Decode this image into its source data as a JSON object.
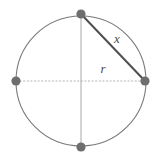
{
  "figure": {
    "type": "geometry-diagram",
    "background_color": "#ffffff",
    "width": 158,
    "height": 162
  },
  "colors": {
    "circle_stroke": "#7a7a7a",
    "node_fill": "#6e6e6e",
    "chord_stroke": "#4f4f4f",
    "vertical_axis_stroke": "#a9a9a9",
    "horizontal_axis_stroke": "#b4b4b4",
    "label_color": "#4a4a4a"
  },
  "circle": {
    "center_x": 81,
    "center_y": 81,
    "radius": 65,
    "stroke_width": 1.1,
    "fill": "none"
  },
  "nodes": [
    {
      "id": "node-top",
      "label": "top point",
      "cx": 81,
      "cy": 14,
      "r": 4.6
    },
    {
      "id": "node-right",
      "label": "right point",
      "cx": 145,
      "cy": 81,
      "r": 4.6
    },
    {
      "id": "node-bottom",
      "label": "bottom point",
      "cx": 81,
      "cy": 147,
      "r": 4.6
    },
    {
      "id": "node-left",
      "label": "left point",
      "cx": 16,
      "cy": 81,
      "r": 4.6
    }
  ],
  "segments": {
    "vertical_diameter": {
      "name": "vertical diameter",
      "x1": 81,
      "y1": 14,
      "x2": 81,
      "y2": 147,
      "stroke_width": 1.0,
      "dash": "none"
    },
    "horizontal_radius_line": {
      "name": "horizontal diameter",
      "x1": 16,
      "y1": 81,
      "x2": 145,
      "y2": 81,
      "stroke_width": 1.0,
      "dash": "2,1.6"
    },
    "chord": {
      "name": "chord x",
      "x1": 81,
      "y1": 14,
      "x2": 145,
      "y2": 81,
      "stroke_width": 2.0,
      "dash": "none"
    }
  },
  "labels": {
    "chord_label": {
      "text": "x",
      "x": 117,
      "y": 40
    },
    "radius_label": {
      "text": "r",
      "x": 103,
      "y": 70
    }
  }
}
